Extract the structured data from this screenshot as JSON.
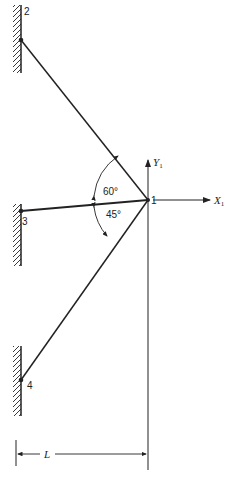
{
  "diagram": {
    "type": "truss-structure",
    "nodes": [
      {
        "id": "1",
        "label": "1",
        "x": 148,
        "y": 200
      },
      {
        "id": "2",
        "label": "2",
        "x": 21,
        "y": 40
      },
      {
        "id": "3",
        "label": "3",
        "x": 21,
        "y": 211
      },
      {
        "id": "4",
        "label": "4",
        "x": 21,
        "y": 380
      }
    ],
    "members": [
      {
        "from": "1",
        "to": "2"
      },
      {
        "from": "1",
        "to": "3"
      },
      {
        "from": "1",
        "to": "4"
      }
    ],
    "angles": [
      {
        "label": "60°",
        "between": [
          "1-2",
          "1-3"
        ]
      },
      {
        "label": "45°",
        "between": [
          "1-3",
          "1-4"
        ]
      }
    ],
    "axes": {
      "x_label": "X",
      "x_sub": "1",
      "y_label": "Y",
      "y_sub": "1"
    },
    "dimension": {
      "label": "L"
    },
    "colors": {
      "line": "#222222",
      "background": "#ffffff"
    }
  }
}
